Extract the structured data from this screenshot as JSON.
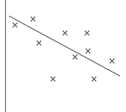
{
  "colors": {
    "background": "#ffffff",
    "axis": "#8a8a8a",
    "marker": "#6e6e6e",
    "trendline": "#7a7a7a"
  },
  "chart_data": {
    "type": "scatter",
    "title": "",
    "xlabel": "",
    "ylabel": "",
    "grid": false,
    "legend": null,
    "marker": "x",
    "xlim": [
      0,
      120
    ],
    "ylim": [
      0,
      112
    ],
    "series": [
      {
        "name": "points",
        "points": [
          {
            "x": 10,
            "y": 87
          },
          {
            "x": 28,
            "y": 93
          },
          {
            "x": 34,
            "y": 69
          },
          {
            "x": 60,
            "y": 79
          },
          {
            "x": 82,
            "y": 79
          },
          {
            "x": 83,
            "y": 61
          },
          {
            "x": 70,
            "y": 55
          },
          {
            "x": 107,
            "y": 51
          },
          {
            "x": 48,
            "y": 33
          },
          {
            "x": 89,
            "y": 33
          }
        ]
      }
    ],
    "trendline": {
      "type": "linear",
      "from": {
        "x": 4,
        "y": 96
      },
      "to": {
        "x": 115,
        "y": 36
      }
    }
  }
}
